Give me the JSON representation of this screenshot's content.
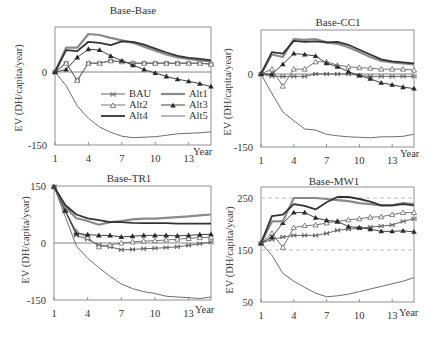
{
  "colors": {
    "BAU": "#555555",
    "Alt1": "#8a8a8a",
    "Alt2": "#666666",
    "Alt3": "#2a2a2a",
    "Alt4": "#333333",
    "Alt5": "#6e6e6e",
    "axis": "#777777",
    "zero_line": "#666666",
    "dashed": "#aaaaaa"
  },
  "legend": {
    "entries": [
      {
        "name": "BAU",
        "marker": "x"
      },
      {
        "name": "Alt1",
        "marker": "none"
      },
      {
        "name": "Alt2",
        "marker": "triangle-open"
      },
      {
        "name": "Alt3",
        "marker": "triangle-filled"
      },
      {
        "name": "Alt4",
        "marker": "none"
      },
      {
        "name": "Alt5",
        "marker": "none"
      }
    ]
  },
  "chart_data": [
    {
      "type": "line",
      "title": "Base-Base",
      "xlabel": "Year",
      "ylabel": "EV (DH/capita/year)",
      "x": [
        1,
        2,
        3,
        4,
        5,
        6,
        7,
        8,
        9,
        10,
        11,
        12,
        13,
        14,
        15
      ],
      "xticks": [
        "1",
        "4",
        "7",
        "10",
        "13"
      ],
      "yticks": [
        "0",
        "-150"
      ],
      "ylim": [
        -150,
        92
      ],
      "grid": false,
      "legend_position": "inside-lower-center",
      "series": [
        {
          "name": "BAU",
          "values": [
            0,
            18,
            -17,
            18,
            18,
            23,
            21,
            18,
            18,
            18,
            18,
            18,
            18,
            18,
            16
          ]
        },
        {
          "name": "Alt1",
          "values": [
            0,
            50,
            50,
            78,
            76,
            70,
            65,
            60,
            52,
            44,
            36,
            30,
            27,
            24,
            22
          ]
        },
        {
          "name": "Alt2",
          "values": [
            0,
            18,
            -17,
            18,
            18,
            23,
            21,
            18,
            18,
            18,
            18,
            18,
            18,
            18,
            16
          ]
        },
        {
          "name": "Alt3",
          "values": [
            0,
            5,
            30,
            47,
            45,
            33,
            23,
            14,
            5,
            -2,
            -9,
            -15,
            -19,
            -24,
            -30
          ]
        },
        {
          "name": "Alt4",
          "values": [
            0,
            45,
            43,
            62,
            60,
            55,
            63,
            62,
            56,
            48,
            40,
            33,
            29,
            27,
            24
          ]
        },
        {
          "name": "Alt5",
          "values": [
            0,
            -28,
            -70,
            -95,
            -113,
            -124,
            -132,
            -135,
            -134,
            -133,
            -130,
            -127,
            -126,
            -125,
            -123
          ]
        }
      ]
    },
    {
      "type": "line",
      "title": "Base-CC1",
      "xlabel": "Year",
      "ylabel": "EV (DH/capita/year)",
      "x": [
        1,
        2,
        3,
        4,
        5,
        6,
        7,
        8,
        9,
        10,
        11,
        12,
        13,
        14,
        15
      ],
      "xticks": [
        "1",
        "4",
        "7",
        "10",
        "13"
      ],
      "yticks": [
        "0",
        "-150"
      ],
      "ylim": [
        -150,
        90
      ],
      "grid": false,
      "series": [
        {
          "name": "BAU",
          "values": [
            0,
            -5,
            -5,
            -5,
            -5,
            0,
            0,
            0,
            0,
            -3,
            -5,
            -5,
            -5,
            -5,
            -5
          ]
        },
        {
          "name": "Alt1",
          "values": [
            0,
            40,
            35,
            72,
            70,
            72,
            65,
            62,
            55,
            45,
            35,
            27,
            24,
            22,
            20
          ]
        },
        {
          "name": "Alt2",
          "values": [
            0,
            10,
            -25,
            10,
            10,
            25,
            25,
            18,
            15,
            13,
            12,
            10,
            10,
            10,
            8
          ]
        },
        {
          "name": "Alt3",
          "values": [
            0,
            0,
            20,
            42,
            40,
            37,
            22,
            15,
            5,
            -3,
            -10,
            -18,
            -22,
            -27,
            -30
          ]
        },
        {
          "name": "Alt4",
          "values": [
            0,
            45,
            42,
            68,
            66,
            67,
            65,
            66,
            60,
            50,
            40,
            30,
            26,
            24,
            22
          ]
        },
        {
          "name": "Alt5",
          "values": [
            0,
            -40,
            -78,
            -96,
            -113,
            -115,
            -124,
            -127,
            -129,
            -130,
            -131,
            -129,
            -129,
            -128,
            -124
          ]
        }
      ]
    },
    {
      "type": "line",
      "title": "Base-TR1",
      "xlabel": "Year",
      "ylabel": "EV (DH/capita/year)",
      "x": [
        1,
        2,
        3,
        4,
        5,
        6,
        7,
        8,
        9,
        10,
        11,
        12,
        13,
        14,
        15
      ],
      "xticks": [
        "1",
        "4",
        "7",
        "10",
        "13"
      ],
      "yticks": [
        "150",
        "0",
        "-150"
      ],
      "ylim": [
        -150,
        150
      ],
      "grid": false,
      "series": [
        {
          "name": "BAU",
          "values": [
            148,
            85,
            20,
            10,
            -5,
            -10,
            -18,
            -17,
            -15,
            -14,
            -12,
            -10,
            -6,
            -2,
            2
          ]
        },
        {
          "name": "Alt1",
          "values": [
            148,
            95,
            65,
            58,
            48,
            55,
            58,
            62,
            64,
            64,
            66,
            68,
            70,
            73,
            75
          ]
        },
        {
          "name": "Alt2",
          "values": [
            148,
            85,
            30,
            15,
            -10,
            -5,
            0,
            3,
            5,
            6,
            8,
            10,
            12,
            14,
            15
          ]
        },
        {
          "name": "Alt3",
          "values": [
            148,
            85,
            25,
            22,
            20,
            20,
            16,
            18,
            20,
            20,
            20,
            19,
            20,
            22,
            23
          ]
        },
        {
          "name": "Alt4",
          "values": [
            148,
            100,
            75,
            65,
            60,
            55,
            55,
            53,
            52,
            52,
            52,
            51,
            51,
            51,
            51
          ]
        },
        {
          "name": "Alt5",
          "values": [
            148,
            70,
            -8,
            -40,
            -65,
            -88,
            -108,
            -120,
            -128,
            -133,
            -140,
            -142,
            -144,
            -146,
            -142
          ]
        }
      ]
    },
    {
      "type": "line",
      "title": "Base-MW1",
      "xlabel": "Year",
      "ylabel": "EV (DH/capita/year)",
      "x": [
        1,
        2,
        3,
        4,
        5,
        6,
        7,
        8,
        9,
        10,
        11,
        12,
        13,
        14,
        15
      ],
      "xticks": [
        "1",
        "4",
        "7",
        "10",
        "13"
      ],
      "yticks": [
        "250",
        "150",
        "50"
      ],
      "ylim": [
        50,
        270
      ],
      "grid": false,
      "reference_lines": [
        250,
        150
      ],
      "series": [
        {
          "name": "BAU",
          "values": [
            163,
            170,
            175,
            178,
            178,
            178,
            182,
            188,
            190,
            192,
            194,
            196,
            198,
            205,
            210
          ]
        },
        {
          "name": "Alt1",
          "values": [
            163,
            205,
            205,
            250,
            250,
            250,
            248,
            246,
            244,
            240,
            238,
            236,
            236,
            240,
            238
          ]
        },
        {
          "name": "Alt2",
          "values": [
            163,
            182,
            155,
            193,
            197,
            198,
            202,
            205,
            208,
            210,
            213,
            214,
            218,
            222,
            222
          ]
        },
        {
          "name": "Alt3",
          "values": [
            163,
            175,
            202,
            222,
            222,
            212,
            207,
            205,
            195,
            193,
            190,
            186,
            186,
            187,
            185
          ]
        },
        {
          "name": "Alt4",
          "values": [
            163,
            215,
            218,
            238,
            235,
            228,
            242,
            252,
            252,
            248,
            243,
            236,
            236,
            238,
            236
          ]
        },
        {
          "name": "Alt5",
          "values": [
            163,
            140,
            105,
            90,
            78,
            67,
            60,
            62,
            65,
            70,
            75,
            80,
            85,
            90,
            97
          ]
        }
      ]
    }
  ],
  "panels": [
    {
      "left": 55,
      "right": 211,
      "top": 27,
      "bottom": 145,
      "y0": 72,
      "ymin_val": -150,
      "ymax_val": 0,
      "ymin_px": 145,
      "ymax_px": 72,
      "title_y": 11
    },
    {
      "left": 261,
      "right": 414,
      "top": 30,
      "bottom": 147,
      "ymin_val": -150,
      "ymax_val": 0,
      "ymin_px": 147,
      "ymax_px": 74,
      "title_y": 13
    },
    {
      "left": 54,
      "right": 211,
      "top": 186,
      "bottom": 300,
      "ymin_val": -150,
      "ymax_val": 150,
      "ymin_px": 300,
      "ymax_px": 186,
      "title_y": 170
    },
    {
      "left": 261,
      "right": 414,
      "top": 187,
      "bottom": 302,
      "ymin_val": 50,
      "ymax_val": 250,
      "ymin_px": 302,
      "ymax_px": 198,
      "title_y": 171
    }
  ]
}
